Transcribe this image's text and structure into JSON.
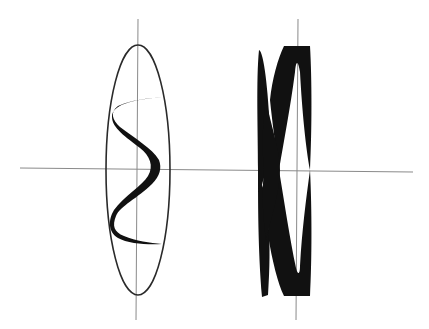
{
  "figure": {
    "colors": {
      "axis": "#8a8a8a",
      "ellipse": "#2a2a2a",
      "ribbon": "#111111",
      "background": "#ffffff"
    },
    "left_panel": {
      "label": "",
      "shape": "helix ribbon inside ellipse"
    },
    "right_panel": {
      "label": "",
      "shape": "dense overlapping ribbon crossing pattern"
    }
  }
}
